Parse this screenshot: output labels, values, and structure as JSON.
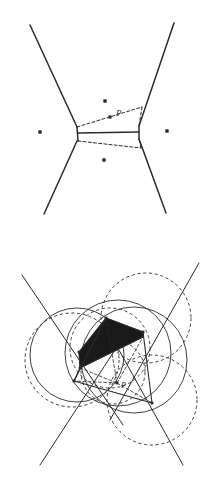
{
  "page": {
    "width": 215,
    "height": 490,
    "background": "#ffffff",
    "ink_color": "#2b2b2b",
    "shade_color": "#1a1a1a"
  },
  "figures": [
    {
      "id": "voronoi-site-insertion",
      "title": "",
      "label_p": "P",
      "viewbox": "0 0 215 240",
      "sites": [
        {
          "name": "site-left",
          "x": 40,
          "y": 132
        },
        {
          "name": "site-right",
          "x": 167,
          "y": 131
        },
        {
          "name": "site-top",
          "x": 105,
          "y": 101
        },
        {
          "name": "site-bottom",
          "x": 104,
          "y": 160
        },
        {
          "name": "site-p",
          "x": 110,
          "y": 117
        }
      ],
      "solid_edges": [
        {
          "name": "edge-upper-left",
          "x1": 30,
          "y1": 25,
          "x2": 77,
          "y2": 127
        },
        {
          "name": "edge-upper-right",
          "x1": 174,
          "y1": 23,
          "x2": 139,
          "y2": 126
        },
        {
          "name": "edge-lower-left",
          "x1": 77,
          "y1": 141,
          "x2": 44,
          "y2": 214
        },
        {
          "name": "edge-lower-right",
          "x1": 139,
          "y1": 139,
          "x2": 166,
          "y2": 213
        },
        {
          "name": "edge-middle",
          "x1": 78,
          "y1": 133,
          "x2": 139,
          "y2": 132
        },
        {
          "name": "edge-left-cap",
          "x1": 77,
          "y1": 127,
          "x2": 78,
          "y2": 141
        },
        {
          "name": "edge-right-cap",
          "x1": 139,
          "y1": 126,
          "x2": 139,
          "y2": 139
        }
      ],
      "dashed_edges": [
        {
          "name": "dashed-upper",
          "x1": 77,
          "y1": 127,
          "x2": 142,
          "y2": 107
        },
        {
          "name": "dashed-right-up",
          "x1": 142,
          "y1": 107,
          "x2": 139,
          "y2": 126
        },
        {
          "name": "dashed-lower",
          "x1": 78,
          "y1": 141,
          "x2": 141,
          "y2": 148
        },
        {
          "name": "dashed-right-down",
          "x1": 141,
          "y1": 148,
          "x2": 139,
          "y2": 139
        }
      ]
    },
    {
      "id": "delaunay-circumcircle-construction",
      "title": "",
      "label_p": "P",
      "viewbox": "0 245 215 245",
      "sites": [
        {
          "name": "vertex-a",
          "x": 79,
          "y": 352
        },
        {
          "name": "vertex-b",
          "x": 80,
          "y": 368
        },
        {
          "name": "vertex-c",
          "x": 106,
          "y": 318
        },
        {
          "name": "vertex-d",
          "x": 143,
          "y": 332
        },
        {
          "name": "vertex-e",
          "x": 152,
          "y": 403
        },
        {
          "name": "vertex-f",
          "x": 74,
          "y": 381
        },
        {
          "name": "vertex-p",
          "x": 117,
          "y": 383
        }
      ],
      "solid_circles": [
        {
          "name": "circumcircle-left",
          "cx": 77,
          "cy": 355,
          "r": 47
        },
        {
          "name": "circumcircle-center",
          "cx": 118,
          "cy": 353,
          "r": 53
        },
        {
          "name": "circumcircle-right",
          "cx": 134,
          "cy": 360,
          "r": 53
        }
      ],
      "dashed_circles": [
        {
          "name": "dashed-circle-left",
          "cx": 72,
          "cy": 360,
          "r": 47
        },
        {
          "name": "dashed-circle-upper-right",
          "cx": 146,
          "cy": 318,
          "r": 45
        },
        {
          "name": "dashed-circle-lower-right",
          "cx": 152,
          "cy": 400,
          "r": 45
        },
        {
          "name": "dashed-circle-inner",
          "cx": 113,
          "cy": 372,
          "r": 32
        },
        {
          "name": "dashed-circle-mid",
          "cx": 110,
          "cy": 348,
          "r": 40
        }
      ],
      "solid_rays": [
        {
          "name": "ray-upper-left",
          "x1": 22,
          "y1": 275,
          "x2": 123,
          "y2": 425
        },
        {
          "name": "ray-upper-right",
          "x1": 199,
          "y1": 263,
          "x2": 110,
          "y2": 420
        },
        {
          "name": "ray-lower-left",
          "x1": 40,
          "y1": 465,
          "x2": 128,
          "y2": 330
        },
        {
          "name": "ray-lower-right",
          "x1": 183,
          "y1": 465,
          "x2": 105,
          "y2": 325
        }
      ],
      "solid_edges": [
        {
          "name": "quad-left-side",
          "x1": 79,
          "y1": 352,
          "x2": 80,
          "y2": 368
        },
        {
          "name": "quad-bottom",
          "x1": 80,
          "y1": 368,
          "x2": 143,
          "y2": 337
        },
        {
          "name": "quad-right-side",
          "x1": 143,
          "y1": 332,
          "x2": 143,
          "y2": 337
        },
        {
          "name": "edge-a-c",
          "x1": 79,
          "y1": 352,
          "x2": 106,
          "y2": 318
        },
        {
          "name": "edge-c-d",
          "x1": 106,
          "y1": 318,
          "x2": 143,
          "y2": 332
        },
        {
          "name": "edge-d-e",
          "x1": 143,
          "y1": 332,
          "x2": 152,
          "y2": 403
        },
        {
          "name": "edge-b-f",
          "x1": 80,
          "y1": 368,
          "x2": 74,
          "y2": 381
        },
        {
          "name": "edge-f-e",
          "x1": 74,
          "y1": 381,
          "x2": 152,
          "y2": 403
        },
        {
          "name": "edge-f-c",
          "x1": 74,
          "y1": 381,
          "x2": 106,
          "y2": 318
        }
      ],
      "dashed_edges": [
        {
          "name": "dashed-b-p",
          "x1": 80,
          "y1": 368,
          "x2": 117,
          "y2": 383
        },
        {
          "name": "dashed-p-d",
          "x1": 117,
          "y1": 383,
          "x2": 143,
          "y2": 337
        },
        {
          "name": "dashed-p-e",
          "x1": 117,
          "y1": 383,
          "x2": 152,
          "y2": 403
        },
        {
          "name": "dashed-p-c",
          "x1": 117,
          "y1": 383,
          "x2": 106,
          "y2": 318
        },
        {
          "name": "dashed-p-f",
          "x1": 117,
          "y1": 383,
          "x2": 74,
          "y2": 381
        }
      ],
      "shaded_region": {
        "name": "shaded-quadrilateral",
        "points": "79,352 106,318 143,332 143,337 80,368"
      }
    }
  ]
}
